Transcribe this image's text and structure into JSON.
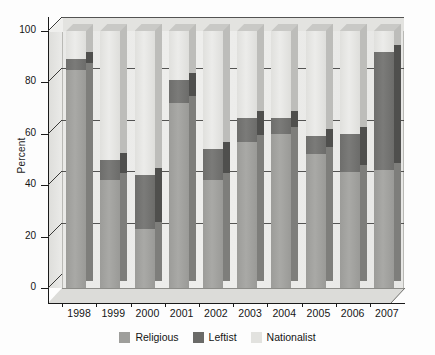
{
  "chart_data": {
    "type": "bar",
    "subtype": "stacked-3d-column",
    "title": "",
    "xlabel": "",
    "ylabel": "Percent",
    "ylim": [
      0,
      100
    ],
    "yticks": [
      0,
      20,
      40,
      60,
      80,
      100
    ],
    "grid": true,
    "stacked": true,
    "stack_total": 100,
    "legend_position": "bottom",
    "categories": [
      "1998",
      "1999",
      "2000",
      "2001",
      "2002",
      "2003",
      "2004",
      "2005",
      "2006",
      "2007"
    ],
    "series": [
      {
        "name": "Religious",
        "color": "#9e9e9b",
        "values": [
          85,
          42,
          23,
          72,
          42,
          57,
          60,
          52,
          45,
          46
        ]
      },
      {
        "name": "Leftist",
        "color": "#6a6a68",
        "values": [
          4,
          8,
          21,
          9,
          12,
          9,
          6,
          7,
          15,
          46
        ]
      },
      {
        "name": "Nationalist",
        "color": "#e2e2df",
        "values": [
          11,
          50,
          56,
          19,
          46,
          34,
          34,
          41,
          40,
          8
        ]
      }
    ]
  },
  "axis": {
    "y_title": "Percent",
    "y_ticks": [
      "0",
      "20",
      "40",
      "60",
      "80",
      "100"
    ],
    "x_ticks": [
      "1998",
      "1999",
      "2000",
      "2001",
      "2002",
      "2003",
      "2004",
      "2005",
      "2006",
      "2007"
    ]
  },
  "legend": {
    "items": [
      {
        "label": "Religious",
        "color": "#9e9e9b"
      },
      {
        "label": "Leftist",
        "color": "#6a6a68"
      },
      {
        "label": "Nationalist",
        "color": "#e2e2df"
      }
    ]
  }
}
